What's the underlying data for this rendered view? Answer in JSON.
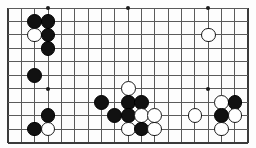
{
  "figure": {
    "kind": "go-board-diagram",
    "board": {
      "columns": 19,
      "rows": 11,
      "origin_x": 8,
      "origin_y": 8,
      "pitch_x": 13.35,
      "pitch_y": 13.45,
      "line_color": "#5a5a5a",
      "edge_color": "#3a3a3a",
      "background_color": "#fdfdfd",
      "edges": {
        "left": true,
        "top": false,
        "right": true,
        "bottom": true
      }
    },
    "hoshi_label": "star-point",
    "hoshi": [
      {
        "col": 3,
        "row": 0
      },
      {
        "col": 9,
        "row": 0
      },
      {
        "col": 15,
        "row": 0
      },
      {
        "col": 3,
        "row": 6
      },
      {
        "col": 15,
        "row": 6
      }
    ],
    "stone_colors": {
      "black": "#111111",
      "white": "#ffffff"
    },
    "stone_radius": 7.4,
    "stones": [
      {
        "color": "black",
        "col": 2,
        "row": 1
      },
      {
        "color": "black",
        "col": 3,
        "row": 1
      },
      {
        "color": "white",
        "col": 2,
        "row": 2
      },
      {
        "color": "black",
        "col": 3,
        "row": 2
      },
      {
        "color": "black",
        "col": 3,
        "row": 3
      },
      {
        "color": "white",
        "col": 15,
        "row": 2
      },
      {
        "color": "black",
        "col": 2,
        "row": 5
      },
      {
        "color": "white",
        "col": 9,
        "row": 6
      },
      {
        "color": "black",
        "col": 7,
        "row": 7
      },
      {
        "color": "black",
        "col": 9,
        "row": 7
      },
      {
        "color": "black",
        "col": 10,
        "row": 7
      },
      {
        "color": "white",
        "col": 16,
        "row": 7
      },
      {
        "color": "black",
        "col": 17,
        "row": 7
      },
      {
        "color": "black",
        "col": 3,
        "row": 8
      },
      {
        "color": "black",
        "col": 8,
        "row": 8
      },
      {
        "color": "black",
        "col": 9,
        "row": 8
      },
      {
        "color": "white",
        "col": 10,
        "row": 8
      },
      {
        "color": "white",
        "col": 11,
        "row": 8
      },
      {
        "color": "white",
        "col": 14,
        "row": 8
      },
      {
        "color": "black",
        "col": 16,
        "row": 8
      },
      {
        "color": "white",
        "col": 17,
        "row": 8
      },
      {
        "color": "black",
        "col": 2,
        "row": 9
      },
      {
        "color": "white",
        "col": 3,
        "row": 9
      },
      {
        "color": "white",
        "col": 9,
        "row": 9
      },
      {
        "color": "black",
        "col": 10,
        "row": 9
      },
      {
        "color": "white",
        "col": 11,
        "row": 9
      },
      {
        "color": "white",
        "col": 16,
        "row": 9
      }
    ]
  }
}
